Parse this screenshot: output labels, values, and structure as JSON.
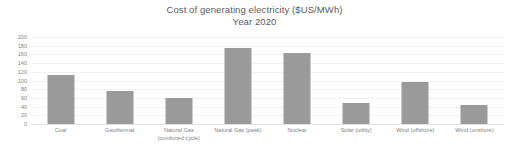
{
  "chart_data": {
    "type": "bar",
    "title": "Cost of generating electricity ($US/MWh)",
    "subtitle": "Year 2020",
    "xlabel": "",
    "ylabel": "",
    "ylim": [
      0,
      200
    ],
    "y_ticks": [
      200,
      180,
      160,
      140,
      120,
      100,
      80,
      60,
      40,
      20,
      0
    ],
    "grid": true,
    "legend": false,
    "bar_color": "#9a9a9a",
    "categories": [
      "Coal",
      "Geothermal",
      "Natural Gas (combined cycle)",
      "Natural Gas (peak)",
      "Nuclear",
      "Solar (utility)",
      "Wind (offshore)",
      "Wind (onshore)"
    ],
    "category_lines": [
      [
        "Coal"
      ],
      [
        "Geothermal"
      ],
      [
        "Natural Gas",
        "(combined cycle)"
      ],
      [
        "Natural Gas (peak)"
      ],
      [
        "Nuclear"
      ],
      [
        "Solar (utility)"
      ],
      [
        "Wind (offshore)"
      ],
      [
        "Wind (onshore)"
      ]
    ],
    "values": [
      112,
      76,
      59,
      175,
      163,
      48,
      97,
      44
    ]
  }
}
